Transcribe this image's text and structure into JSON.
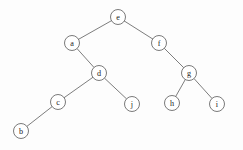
{
  "figure": {
    "width": 243,
    "height": 150,
    "background_color": "#fdfdfd",
    "node_fill_color": "#ffffff",
    "node_stroke_color": "#6b6b6b",
    "edge_color": "#6e6e6e",
    "label_color": "#1c1c1c",
    "node_radius": 7.5
  },
  "chart_data": {
    "type": "diagram",
    "diagram_type": "binary-tree",
    "root": "e",
    "nodes": [
      {
        "id": "e",
        "label": "e",
        "x": 118,
        "y": 17,
        "depth": 0
      },
      {
        "id": "a",
        "label": "a",
        "x": 72,
        "y": 43,
        "depth": 1
      },
      {
        "id": "f",
        "label": "f",
        "x": 159,
        "y": 43,
        "depth": 1
      },
      {
        "id": "d",
        "label": "d",
        "x": 99,
        "y": 73,
        "depth": 2
      },
      {
        "id": "g",
        "label": "g",
        "x": 189,
        "y": 73,
        "depth": 2
      },
      {
        "id": "c",
        "label": "c",
        "x": 58,
        "y": 102,
        "depth": 3
      },
      {
        "id": "j",
        "label": "j",
        "x": 132,
        "y": 104,
        "depth": 3
      },
      {
        "id": "h",
        "label": "h",
        "x": 172,
        "y": 103,
        "depth": 3
      },
      {
        "id": "i",
        "label": "i",
        "x": 217,
        "y": 104,
        "depth": 3
      },
      {
        "id": "b",
        "label": "b",
        "x": 21,
        "y": 131,
        "depth": 4
      }
    ],
    "edges": [
      {
        "from": "e",
        "to": "a",
        "side": "left"
      },
      {
        "from": "e",
        "to": "f",
        "side": "right"
      },
      {
        "from": "a",
        "to": "d",
        "side": "right"
      },
      {
        "from": "f",
        "to": "g",
        "side": "right"
      },
      {
        "from": "d",
        "to": "c",
        "side": "left"
      },
      {
        "from": "d",
        "to": "j",
        "side": "right"
      },
      {
        "from": "g",
        "to": "h",
        "side": "left"
      },
      {
        "from": "g",
        "to": "i",
        "side": "right"
      },
      {
        "from": "c",
        "to": "b",
        "side": "left"
      }
    ]
  }
}
